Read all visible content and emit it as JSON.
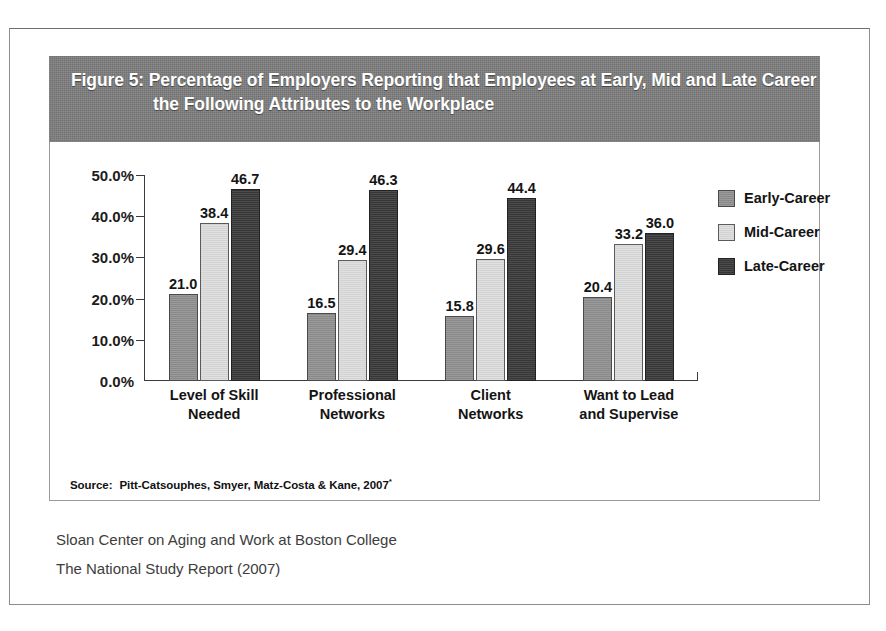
{
  "figure": {
    "title": "Figure 5: Percentage of Employers Reporting that Employees at Early, Mid and Late Career Bring the Following Attributes to the Workplace",
    "source_label": "Source:",
    "source_text": "Pitt-Catsouphes, Smyer, Matz-Costa & Kane, 2007",
    "source_marker": "*"
  },
  "footer": {
    "line1": "Sloan Center on Aging and Work at Boston College",
    "line2": "The National Study Report (2007)"
  },
  "colors": {
    "title_band": "#7d7d7d",
    "early_career": "#8f8f8f",
    "mid_career": "#dcdcdc",
    "late_career": "#383838",
    "axis": "#3b3b3b",
    "panel_border": "#9a9a9a"
  },
  "chart_data": {
    "type": "bar",
    "title": "Figure 5: Percentage of Employers Reporting that Employees at Early, Mid and Late Career Bring the Following Attributes to the Workplace",
    "xlabel": "",
    "ylabel": "",
    "ylim": [
      0,
      50
    ],
    "grid": false,
    "legend_position": "right",
    "ytick_labels": [
      "0.0%",
      "10.0%",
      "20.0%",
      "30.0%",
      "40.0%",
      "50.0%"
    ],
    "ytick_values": [
      0,
      10,
      20,
      30,
      40,
      50
    ],
    "categories": [
      "Level of Skill Needed",
      "Professional Networks",
      "Client Networks",
      "Want to Lead and Supervise"
    ],
    "category_lines": [
      [
        "Level of Skill",
        "Needed"
      ],
      [
        "Professional",
        "Networks"
      ],
      [
        "Client",
        "Networks"
      ],
      [
        "Want to Lead",
        "and Supervise"
      ]
    ],
    "series": [
      {
        "name": "Early-Career",
        "color": "#8f8f8f",
        "values": [
          21.0,
          16.5,
          15.8,
          20.4
        ],
        "labels": [
          "21.0",
          "16.5",
          "15.8",
          "20.4"
        ]
      },
      {
        "name": "Mid-Career",
        "color": "#dcdcdc",
        "values": [
          38.4,
          29.4,
          29.6,
          33.2
        ],
        "labels": [
          "38.4",
          "29.4",
          "29.6",
          "33.2"
        ]
      },
      {
        "name": "Late-Career",
        "color": "#383838",
        "values": [
          46.7,
          46.3,
          44.4,
          36.0
        ],
        "labels": [
          "46.7",
          "46.3",
          "44.4",
          "36.0"
        ]
      }
    ]
  }
}
